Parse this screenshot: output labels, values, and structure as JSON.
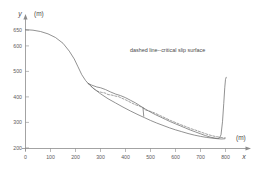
{
  "chart_data": {
    "type": "line",
    "title": "",
    "xlabel": "x",
    "ylabel": "y",
    "x_unit": "(m)",
    "y_unit": "(m)",
    "xlim": [
      0,
      830
    ],
    "ylim": [
      195,
      665
    ],
    "xticks": [
      0,
      100,
      200,
      300,
      400,
      500,
      600,
      700,
      800
    ],
    "yticks": [
      200,
      300,
      400,
      500,
      600,
      650
    ],
    "grid": false,
    "legend": "none",
    "annotations": [
      {
        "text": "dashed line--critical slip surface",
        "x": 420,
        "y": 545
      }
    ],
    "series": [
      {
        "name": "ground-surface-profile",
        "style": "solid",
        "x": [
          0,
          30,
          60,
          90,
          120,
          150,
          175,
          195,
          210,
          225,
          240,
          250,
          265,
          285,
          300,
          320,
          340,
          360,
          380,
          400,
          420,
          440,
          460,
          480,
          500,
          520,
          540,
          560,
          580,
          600,
          620,
          640,
          660,
          680,
          700,
          720,
          740,
          755,
          768,
          775,
          782,
          788,
          793,
          797,
          800,
          803
        ],
        "y": [
          652,
          650,
          645,
          636,
          622,
          600,
          570,
          540,
          510,
          480,
          458,
          447,
          440,
          433,
          430,
          423,
          414,
          406,
          400,
          392,
          382,
          372,
          360,
          348,
          337,
          327,
          318,
          309,
          300,
          292,
          284,
          276,
          268,
          261,
          254,
          247,
          241,
          238,
          236,
          237,
          250,
          300,
          370,
          430,
          462,
          470
        ]
      },
      {
        "name": "critical-slip-surface",
        "style": "dashed",
        "x": [
          250,
          270,
          290,
          305,
          318,
          330,
          345,
          360,
          372,
          385,
          400,
          420,
          440,
          455,
          470,
          480,
          492,
          505,
          520,
          540,
          560,
          580,
          600,
          620,
          640,
          660,
          680,
          700,
          715,
          730,
          745,
          758,
          770,
          780,
          790,
          800
        ],
        "y": [
          447,
          428,
          416,
          412,
          410,
          404,
          402,
          398,
          396,
          390,
          384,
          374,
          365,
          360,
          353,
          345,
          342,
          338,
          332,
          323,
          314,
          305,
          297,
          289,
          282,
          274,
          268,
          261,
          256,
          251,
          247,
          244,
          242,
          240,
          239,
          238
        ]
      },
      {
        "name": "internal-shear-boundary",
        "style": "solid",
        "x": [
          250,
          275,
          300,
          330,
          360,
          390,
          420,
          450,
          475,
          500,
          525,
          550,
          575,
          600,
          625,
          650,
          675,
          700,
          725,
          750,
          770,
          785,
          797
        ],
        "y": [
          447,
          425,
          407,
          388,
          372,
          356,
          341,
          327,
          316,
          305,
          295,
          286,
          277,
          269,
          262,
          255,
          249,
          244,
          240,
          237,
          235,
          234,
          235
        ]
      },
      {
        "name": "slip-wedge-tie-line",
        "style": "solid",
        "x": [
          470,
          473
        ],
        "y": [
          353,
          321
        ]
      }
    ]
  },
  "axes": {
    "y_axis_name": "y",
    "x_axis_name": "x",
    "y_unit": "(m)",
    "x_unit": "(m)"
  }
}
